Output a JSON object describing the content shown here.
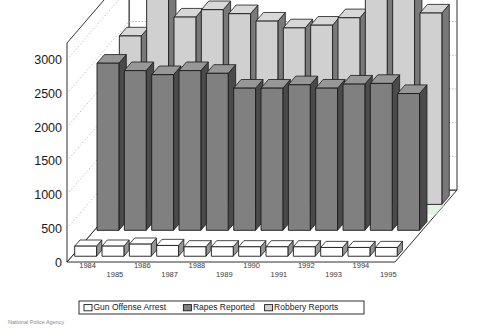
{
  "chart_data": {
    "type": "bar",
    "title": "",
    "subtitle": "",
    "xlabel": "",
    "ylabel": "",
    "ylim": [
      0,
      3250
    ],
    "yticks": [
      0,
      500,
      1000,
      1500,
      2000,
      2500,
      3000
    ],
    "ytick_labels": [
      "0",
      "500",
      "1000",
      "1500",
      "2000",
      "2500",
      "3000"
    ],
    "grid": true,
    "grid_style": "dotted horizontal on back wall",
    "projection": "3d-bar",
    "legend_position": "bottom",
    "categories": [
      "1984",
      "1985",
      "1986",
      "1987",
      "1988",
      "1989",
      "1990",
      "1991",
      "1992",
      "1993",
      "1994",
      "1995"
    ],
    "series": [
      {
        "name": "Gun Offense Arrest",
        "color": "#ffffff",
        "row": "front",
        "values": [
          150,
          150,
          180,
          160,
          140,
          140,
          140,
          140,
          140,
          130,
          130,
          130
        ]
      },
      {
        "name": "Rapes Reported",
        "color": "#808080",
        "row": "middle",
        "values": [
          2480,
          2370,
          2310,
          2370,
          2330,
          2110,
          2110,
          2160,
          2110,
          2170,
          2180,
          2030
        ]
      },
      {
        "name": "Robbery Reports",
        "color": "#d0d0d0",
        "row": "back",
        "values": [
          2500,
          3090,
          2780,
          2890,
          2830,
          2720,
          2620,
          2660,
          2770,
          3120,
          3250,
          2840
        ]
      }
    ]
  },
  "legend": {
    "items": [
      {
        "label": "Gun Offense Arrest",
        "swatch": "#ffffff"
      },
      {
        "label": "Rapes Reported",
        "swatch": "#808080"
      },
      {
        "label": "Robbery Reports",
        "swatch": "#d0d0d0"
      }
    ]
  },
  "caption": {
    "source": "National Police Agency"
  },
  "colors": {
    "bar_front_white": "#ffffff",
    "bar_mid_gray": "#808080",
    "bar_back_light": "#d0d0d0",
    "outline": "#1a1a1a",
    "grid": "#9a9a9a",
    "floor_tint_green": "#d6f0d6",
    "floor_tint_purple": "#a05aa0",
    "text": "#1a1a1a"
  }
}
